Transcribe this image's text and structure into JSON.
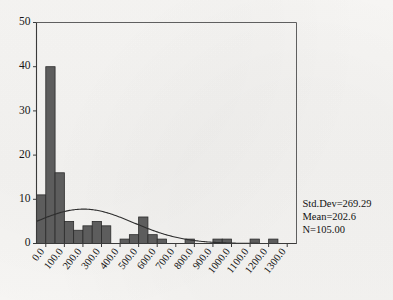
{
  "chart_data": {
    "type": "bar",
    "title": "",
    "subtitle": "",
    "xlabel": "",
    "ylabel": "",
    "xlim": [
      -50,
      1350
    ],
    "ylim": [
      0,
      50
    ],
    "grid": false,
    "legend_position": "none",
    "bin_width": 50,
    "x_tick_labels": [
      "0.0",
      "100.0",
      "200.0",
      "300.0",
      "400.0",
      "500.0",
      "600.0",
      "700.0",
      "800.0",
      "900.0",
      "1000.0",
      "1100.0",
      "1200.0",
      "1300.0"
    ],
    "x_tick_values": [
      0,
      100,
      200,
      300,
      400,
      500,
      600,
      700,
      800,
      900,
      1000,
      1100,
      1200,
      1300
    ],
    "y_tick_labels": [
      "0",
      "10",
      "20",
      "30",
      "40",
      "50"
    ],
    "y_tick_values": [
      0,
      10,
      20,
      30,
      40,
      50
    ],
    "categories": [
      "-25",
      "25",
      "75",
      "125",
      "175",
      "225",
      "275",
      "325",
      "375",
      "425",
      "475",
      "525",
      "575",
      "625",
      "675",
      "725",
      "775",
      "825",
      "875",
      "925",
      "975",
      "1025",
      "1075",
      "1125",
      "1175",
      "1225",
      "1275"
    ],
    "bin_centers": [
      -25,
      25,
      75,
      125,
      175,
      225,
      275,
      325,
      375,
      425,
      475,
      525,
      575,
      625,
      675,
      725,
      775,
      825,
      875,
      925,
      975,
      1025,
      1075,
      1125,
      1175,
      1225,
      1275
    ],
    "values": [
      11,
      40,
      16,
      5,
      3,
      4,
      5,
      4,
      0,
      1,
      2,
      6,
      2,
      1,
      0,
      0,
      1,
      0,
      0,
      1,
      1,
      0,
      0,
      1,
      0,
      1,
      0
    ],
    "curve": {
      "name": "normal-distribution-overlay",
      "mean": 202.6,
      "std_dev": 269.29,
      "peak_value": 7.7
    },
    "annotations": [
      "Std.Dev=269.29",
      "Mean=202.6",
      "N=105.00"
    ],
    "statistics": {
      "std_dev_label": "Std.Dev=269.29",
      "mean_label": "Mean=202.6",
      "n_label": "N=105.00",
      "std_dev": 269.29,
      "mean": 202.6,
      "n": 105.0
    },
    "colors": {
      "bar_fill": "#5d5d5d",
      "bar_border": "#2b2b2b",
      "curve": "#2e2e2e",
      "axis": "#3a3a3a",
      "background": "#f6f5f3",
      "text": "#161616"
    }
  }
}
